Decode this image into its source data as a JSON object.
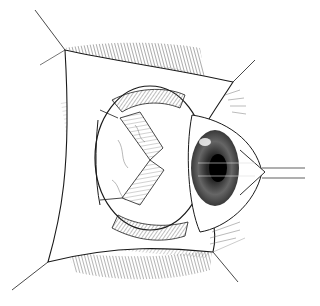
{
  "image": {
    "kind": "medical line illustration",
    "subject": "eye-surgery-exposure",
    "description": "Pen-and-ink illustration of an eyeball exposed within the orbit, with conjunctival flaps retracted at four corners by traction sutures, extraocular muscles visible around the globe, and the cornea/iris/pupil on the right side with sutures extending to the right.",
    "colors": {
      "background": "#ffffff",
      "ink": "#1a1a1a",
      "hatch": "#555555",
      "light_hatch": "#9a9a9a"
    }
  }
}
